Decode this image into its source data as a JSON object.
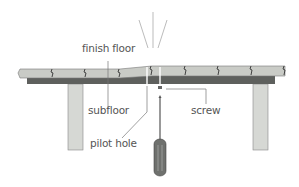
{
  "diagram": {
    "labels": {
      "finish_floor": "finish floor",
      "subfloor": "subfloor",
      "screw": "screw",
      "pilot_hole": "pilot hole"
    },
    "colors": {
      "finish_floor_fill": "#c9cbc6",
      "subfloor_fill": "#5e605d",
      "joist_fill": "#d6d8d4",
      "screwdriver_handle": "#6f716e",
      "line": "#777777",
      "label_text": "#555555"
    },
    "elements": [
      "finish-floor-boards",
      "subfloor",
      "left-joist",
      "right-joist",
      "screw",
      "pilot-hole",
      "screwdriver",
      "squeak-lines"
    ]
  }
}
